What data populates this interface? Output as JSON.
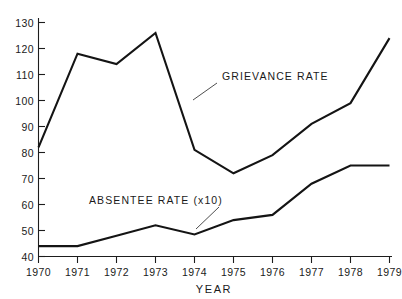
{
  "chart_data": {
    "type": "line",
    "title": "",
    "xlabel": "YEAR",
    "ylabel": "",
    "x": [
      1970,
      1971,
      1972,
      1973,
      1974,
      1975,
      1976,
      1977,
      1978,
      1979
    ],
    "categories": [
      "1970",
      "1971",
      "1972",
      "1973",
      "1974",
      "1975",
      "1976",
      "1977",
      "1978",
      "1979"
    ],
    "series": [
      {
        "name": "GRIEVANCE RATE",
        "values": [
          82,
          118,
          114,
          126,
          81,
          72,
          79,
          91,
          99,
          124
        ]
      },
      {
        "name": "ABSENTEE RATE (x10)",
        "values": [
          44,
          44,
          48,
          52,
          48.5,
          54,
          56,
          68,
          75,
          75
        ]
      }
    ],
    "xlim": [
      1970,
      1979
    ],
    "ylim": [
      40,
      130
    ],
    "ytick_labels": [
      "130",
      "120",
      "110",
      "100",
      "90",
      "80",
      "70",
      "60",
      "50",
      "40"
    ],
    "ytick_values": [
      130,
      120,
      110,
      100,
      90,
      80,
      70,
      60,
      50,
      40
    ],
    "ytick_step": 10,
    "grid": false,
    "legend_position": "inline-annotations",
    "annotations": [
      {
        "text": "GRIEVANCE RATE",
        "series": "GRIEVANCE RATE",
        "leader": true
      },
      {
        "text": "ABSENTEE RATE (x10)",
        "series": "ABSENTEE RATE (x10)",
        "leader": true
      }
    ],
    "colors": {
      "line": "#141414",
      "axis": "#1d1d1d",
      "background": "#ffffff"
    }
  },
  "axes": {
    "x_title": "YEAR",
    "x_tick_labels": [
      "1970",
      "1971",
      "1972",
      "1973",
      "1974",
      "1975",
      "1976",
      "1977",
      "1978",
      "1979"
    ],
    "y_tick_labels": [
      "130",
      "120",
      "110",
      "100",
      "90",
      "80",
      "70",
      "60",
      "50",
      "40"
    ]
  },
  "labels": {
    "grievance": "GRIEVANCE RATE",
    "absentee": "ABSENTEE RATE (x10)"
  }
}
